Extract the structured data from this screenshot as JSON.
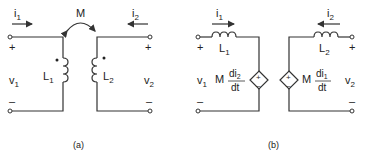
{
  "figure_a": {
    "caption": "(a)",
    "i1": "i",
    "i1_sub": "1",
    "i2": "i",
    "i2_sub": "2",
    "mutual": "M",
    "v1": "v",
    "v1_sub": "1",
    "v2": "v",
    "v2_sub": "2",
    "L1": "L",
    "L1_sub": "1",
    "L2": "L",
    "L2_sub": "2",
    "plus": "+",
    "minus": "–"
  },
  "figure_b": {
    "caption": "(b)",
    "i1": "i",
    "i1_sub": "1",
    "i2": "i",
    "i2_sub": "2",
    "v1": "v",
    "v1_sub": "1",
    "v2": "v",
    "v2_sub": "2",
    "L1": "L",
    "L1_sub": "1",
    "L2": "L",
    "L2_sub": "2",
    "src1_coef": "M",
    "src1_num": "di",
    "src1_num_sub": "2",
    "src1_den": "dt",
    "src2_coef": "M",
    "src2_num": "di",
    "src2_num_sub": "1",
    "src2_den": "dt",
    "plus": "+",
    "minus": "–",
    "src_plus": "+",
    "src_minus": "–"
  },
  "colors": {
    "line": "#333333",
    "text": "#222222",
    "background": "#ffffff"
  }
}
